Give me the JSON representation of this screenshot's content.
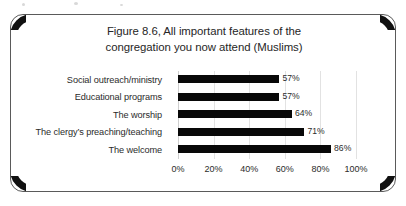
{
  "figure": {
    "title_line1": "Figure 8.6, All important features of the",
    "title_line2": "congregation you now attend (Muslims)"
  },
  "chart_data": {
    "type": "bar",
    "orientation": "horizontal",
    "title": "Figure 8.6, All important features of the congregation you now attend (Muslims)",
    "categories": [
      "Social outreach/ministry",
      "Educational programs",
      "The worship",
      "The clergy’s preaching/teaching",
      "The welcome"
    ],
    "values": [
      57,
      57,
      64,
      71,
      86
    ],
    "data_labels": [
      "57%",
      "57%",
      "64%",
      "71%",
      "86%"
    ],
    "xlabel": "",
    "ylabel": "",
    "xlim": [
      0,
      100
    ],
    "xticks": [
      0,
      20,
      40,
      60,
      80,
      100
    ],
    "xtick_labels": [
      "0%",
      "20%",
      "40%",
      "60%",
      "80%",
      "100%"
    ],
    "grid": true,
    "grid_axis": "x",
    "legend": false,
    "bar_color": "#080808",
    "gridline_color": "#e2e2e2",
    "text_color": "#2b2b2b",
    "background": "#ffffff"
  }
}
